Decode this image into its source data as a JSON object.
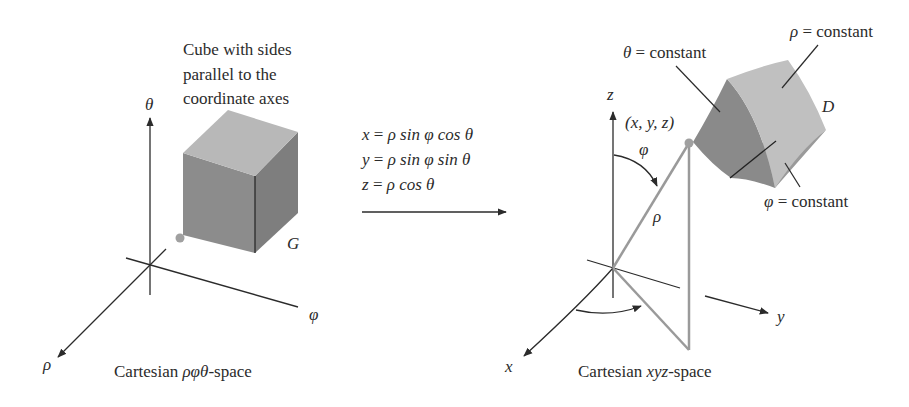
{
  "left_panel": {
    "caption": "Cartesian ρφθ-space",
    "caption_prefix": "Cartesian ",
    "caption_vars": "ρφθ",
    "caption_suffix": "-space",
    "cube_note": [
      "Cube with sides",
      "parallel to the",
      "coordinate axes"
    ],
    "region_label": "G",
    "axes": {
      "vertical": "θ",
      "horizontal": "φ",
      "depth": "ρ"
    }
  },
  "transform": {
    "equations": [
      {
        "lhs": "x",
        "rhs": "ρ sin φ cos θ"
      },
      {
        "lhs": "y",
        "rhs": "ρ sin φ sin θ"
      },
      {
        "lhs": "z",
        "rhs": "ρ cos θ"
      }
    ],
    "eq_sign": "="
  },
  "right_panel": {
    "caption_prefix": "Cartesian ",
    "caption_vars": "xyz",
    "caption_suffix": "-space",
    "point_label": "(x, y, z)",
    "region_label": "D",
    "radius_label": "ρ",
    "polar_angle_label": "φ",
    "axes": {
      "z": "z",
      "y": "y",
      "x": "x"
    },
    "surface_labels": {
      "theta": "θ = constant",
      "rho": "ρ = constant",
      "phi": "φ = constant"
    }
  },
  "colors": {
    "cube_top": "#b8b8b8",
    "cube_front": "#8c8c8c",
    "cube_side": "#7a7a7a",
    "wedge_light": "#c0c0c0",
    "wedge_dark": "#8a8a8a",
    "wedge_bottom": "#9a9a9a",
    "ray": "#9a9a9a",
    "ink": "#2b2b2b"
  }
}
